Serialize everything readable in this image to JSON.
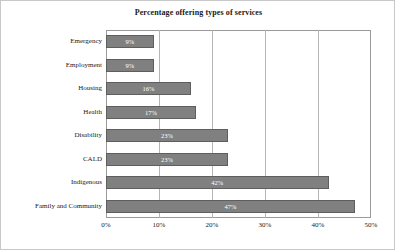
{
  "chart_data": {
    "type": "bar",
    "orientation": "horizontal",
    "title": "Percentage offering types of services",
    "xlabel": "",
    "ylabel": "",
    "categories": [
      "Emergency",
      "Employment",
      "Housing",
      "Health",
      "Disability",
      "CALD",
      "Indigenous",
      "Family and Community"
    ],
    "values": [
      9,
      9,
      16,
      17,
      23,
      23,
      42,
      47
    ],
    "data_labels": [
      "9%",
      "9%",
      "16%",
      "17%",
      "23%",
      "23%",
      "42%",
      "47%"
    ],
    "xlim": [
      0,
      50
    ],
    "xticks": [
      0,
      10,
      20,
      30,
      40,
      50
    ],
    "xtick_labels": [
      "0%",
      "10%",
      "20%",
      "30%",
      "40%",
      "50%"
    ],
    "grid": "vertical",
    "legend": "none",
    "bar_color": "#808080",
    "bar_border_color": "#5e5e5e",
    "label_color": "#ffffff",
    "gridline_color": "#b5b5b5",
    "frame_color": "#9a9a9a",
    "background": "#ffffff"
  }
}
